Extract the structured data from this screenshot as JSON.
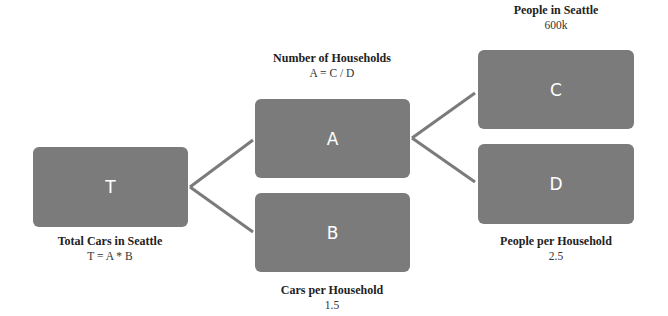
{
  "colors": {
    "box": "#7b7b7b",
    "connector": "#7b7b7b",
    "box_text": "#ffffff"
  },
  "nodes": {
    "T": {
      "letter": "T",
      "title": "Total Cars in Seattle",
      "value": "T = A * B"
    },
    "A": {
      "letter": "A",
      "title": "Number of Households",
      "value": "A = C / D"
    },
    "B": {
      "letter": "B",
      "title": "Cars per Household",
      "value": "1.5"
    },
    "C": {
      "letter": "C",
      "title": "People in Seattle",
      "value": "600k"
    },
    "D": {
      "letter": "D",
      "title": "People per Household",
      "value": "2.5"
    }
  },
  "edges": [
    {
      "from": "T",
      "to": "A"
    },
    {
      "from": "T",
      "to": "B"
    },
    {
      "from": "A",
      "to": "C"
    },
    {
      "from": "A",
      "to": "D"
    }
  ]
}
